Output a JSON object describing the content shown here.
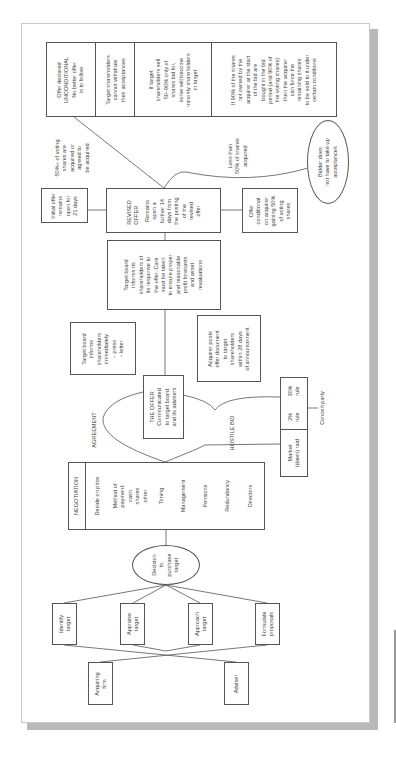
{
  "diagram": {
    "orientation": "rotated-90-ccw",
    "colors": {
      "line": "#555555",
      "text": "#444444",
      "shadow": "#b9b9b9",
      "page_border": "#c9c9c9"
    },
    "outcomes_table": [
      {
        "lines": [
          "Offer declared",
          "UNCONDITIONAL",
          "No better offer",
          "is to follow"
        ]
      },
      {
        "lines": [
          "Target shareholders",
          "cannot withdraw",
          "their acceptances"
        ]
      },
      {
        "lines": [
          "If target",
          "shareholders sell",
          "50–90% only of",
          "shares bid for,",
          "some will become",
          "minority shareholders",
          "in target"
        ]
      },
      {
        "lines": [
          "If 90% of the shares",
          "not owned by the",
          "acquirer at the start",
          "of the bid are",
          "bought in the bid",
          "period (and 90% of",
          "the voting shares)",
          "then the acquirer",
          "can force the",
          "remaining shares",
          "to be sold to it under",
          "certain conditions"
        ]
      }
    ],
    "label_majority": [
      "50%+ of voting",
      "shares are",
      "acquired or",
      "agreed to",
      "be acquired"
    ],
    "label_minority": [
      "Less than",
      "50% of shares",
      "acquired"
    ],
    "bidder_ellipse": [
      "Bidder does",
      "not have to take up",
      "acceptances"
    ],
    "initial_offer": [
      "Initial offer",
      "remains",
      "open for",
      "21 days"
    ],
    "revised_offer": {
      "title": [
        "REVISED",
        "OFFER"
      ],
      "body": [
        "Remains",
        "open a",
        "further 14",
        "days from",
        "the posting",
        "of the",
        "revised",
        "offer"
      ]
    },
    "offer_conditional": [
      "Offer",
      "conditional",
      "on acquirer",
      "gaining 50%",
      "of voting",
      "shares"
    ],
    "target_board_response": [
      "Target board",
      "informs its",
      "shareholders of",
      "its response to",
      "the offer. Care",
      "must be taken",
      "to ensure proper",
      "and reasonable",
      "profit forecasts",
      "and asset",
      "revaluations"
    ],
    "target_board_immediate": [
      "Target board",
      "informs",
      "shareholders",
      "immediately",
      "– press",
      "– letter"
    ],
    "acquirer_posts": [
      "Acquirer posts",
      "offer document",
      "to target",
      "shareholders",
      "within 28 days",
      "of announcement"
    ],
    "the_offer": [
      "THE OFFER",
      "Communicated",
      "to target board",
      "and its advisers"
    ],
    "label_agreement": "AGREEMENT",
    "label_hostile": "HOSTILE BID",
    "rules_box": {
      "rule3": [
        "3%",
        "rule"
      ],
      "rule30": [
        "30%",
        "rule"
      ],
      "market_raid": [
        "Market",
        "(dawn) raid"
      ]
    },
    "concert_party": "Concert party",
    "negotiation": {
      "title": "NEGOTIATION",
      "items": [
        [
          "Decide on price"
        ],
        [
          "Method of",
          "payment:",
          "cash",
          "shares",
          "other"
        ],
        [
          "Timing"
        ],
        [
          "Management"
        ],
        [
          "Pensions"
        ],
        [
          "Redundancy"
        ],
        [
          "Directors"
        ]
      ]
    },
    "decision": [
      "Decision",
      "to",
      "purchase",
      "target"
    ],
    "steps": [
      [
        "Identify",
        "target"
      ],
      [
        "Appraise",
        "target"
      ],
      [
        "Approach",
        "target"
      ],
      [
        "Formulate",
        "proposals"
      ]
    ],
    "actors": [
      [
        "Acquiring",
        "firm"
      ],
      [
        "Adviser"
      ]
    ]
  }
}
